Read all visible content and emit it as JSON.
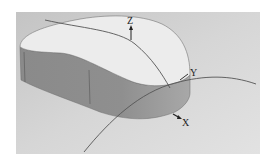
{
  "figure": {
    "type": "3d-solid-model",
    "background_color": "#d4d4d4",
    "panel_color": "#dcdcdc",
    "top_face_color": "#ececec",
    "side_face_color": "#8e8e8e",
    "side_face_light_color": "#a4a4a4",
    "curve_color": "#555555"
  },
  "axes": {
    "z_label": "Z",
    "y_label": "Y",
    "x_label": "X"
  }
}
